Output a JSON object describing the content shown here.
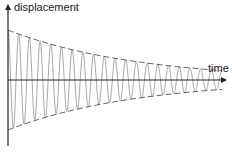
{
  "axes": {
    "y_label": "displacement",
    "x_label": "time"
  },
  "colors": {
    "axis": "#222222",
    "wave": "#a8a8a8",
    "envelope": "#555555",
    "background": "#ffffff"
  },
  "geometry": {
    "origin_x": 8,
    "axis_y": 80,
    "y_axis_top": 5,
    "y_axis_bottom": 146,
    "x_axis_end": 226,
    "amplitude_start": 50,
    "decay_rate": 0.0078,
    "cycles": 20,
    "wave_end_x": 222
  },
  "chart_data": {
    "type": "line",
    "title": "",
    "xlabel": "time",
    "ylabel": "displacement",
    "series": [
      {
        "name": "damped oscillation",
        "description": "sinusoid with exponentially decaying amplitude, ~20 cycles"
      },
      {
        "name": "upper envelope",
        "style": "dashed",
        "description": "+A·e^(-kt)"
      },
      {
        "name": "lower envelope",
        "style": "dashed",
        "description": "-A·e^(-kt)"
      }
    ],
    "grid": false,
    "legend": "none",
    "annotations": []
  }
}
